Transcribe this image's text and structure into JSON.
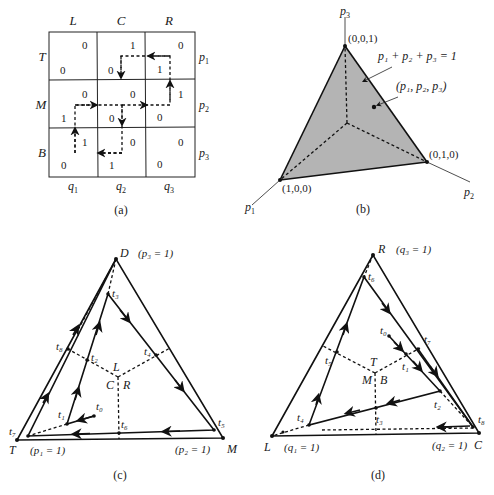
{
  "panel_a": {
    "caption": "(a)",
    "col_headers": [
      "L",
      "C",
      "R"
    ],
    "row_headers": [
      "T",
      "M",
      "B"
    ],
    "row_probs": [
      "p",
      "p",
      "p"
    ],
    "row_prob_subs": [
      "1",
      "2",
      "3"
    ],
    "col_probs": [
      "q",
      "q",
      "q"
    ],
    "col_prob_subs": [
      "1",
      "2",
      "3"
    ],
    "cells": [
      [
        {
          "row_payoff": "0",
          "col_payoff": "0"
        },
        {
          "row_payoff": "0",
          "col_payoff": "1"
        },
        {
          "row_payoff": "1",
          "col_payoff": "0"
        }
      ],
      [
        {
          "row_payoff": "1",
          "col_payoff": "0"
        },
        {
          "row_payoff": "0",
          "col_payoff": "0"
        },
        {
          "row_payoff": "0",
          "col_payoff": "1"
        }
      ],
      [
        {
          "row_payoff": "0",
          "col_payoff": "1"
        },
        {
          "row_payoff": "1",
          "col_payoff": "0"
        },
        {
          "row_payoff": "0",
          "col_payoff": "0"
        }
      ]
    ]
  },
  "panel_b": {
    "caption": "(b)",
    "axis_labels": {
      "p1": "p",
      "p1_sub": "1",
      "p2": "p",
      "p2_sub": "2",
      "p3": "p",
      "p3_sub": "3"
    },
    "vertex_labels": {
      "top": "(0,0,1)",
      "left": "(1,0,0)",
      "right": "(0,1,0)"
    },
    "plane_label": "p₁ + p₂ + p₃ = 1",
    "point_label": "(p₁, p₂, p₃)",
    "fill_color": "#b4b4b4"
  },
  "panel_c": {
    "caption": "(c)",
    "vertices": {
      "top": "D",
      "left": "T",
      "right": "M"
    },
    "vertex_notes": {
      "top": "(p₃ = 1)",
      "left": "(p₁ = 1)",
      "right": "(p₂ = 1)"
    },
    "region_labels": {
      "top": "L",
      "left": "C",
      "right": "R"
    },
    "time_points": [
      "t₀",
      "t₁",
      "t₂",
      "t₃",
      "t₄",
      "t₅",
      "t₆",
      "t₇",
      "t₈"
    ]
  },
  "panel_d": {
    "caption": "(d)",
    "vertices": {
      "top": "R",
      "left": "L",
      "right": "C"
    },
    "vertex_notes": {
      "top": "(q₃ = 1)",
      "left": "(q₁ = 1)",
      "right": "(q₂ = 1)"
    },
    "region_labels": {
      "top": "T",
      "left": "M",
      "right": "B"
    },
    "time_points": [
      "t₀",
      "t₁",
      "t₂",
      "t₃",
      "t₄",
      "t₅",
      "t₆",
      "t₇",
      "t₈"
    ]
  }
}
